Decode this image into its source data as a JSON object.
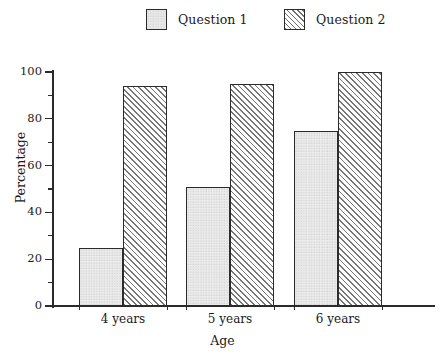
{
  "chart_data": {
    "type": "bar",
    "title": "",
    "subtitle": "",
    "xlabel": "Age",
    "ylabel": "Percentage",
    "categories": [
      "4 years",
      "5 years",
      "6 years"
    ],
    "series": [
      {
        "name": "Question 1",
        "values": [
          25,
          51,
          75
        ],
        "fill": "dotted-light-gray",
        "color": "#ececec"
      },
      {
        "name": "Question 2",
        "values": [
          94,
          95,
          100
        ],
        "fill": "diagonal-hatch",
        "color": "#757575"
      }
    ],
    "ylim": [
      0,
      100
    ],
    "ytick_labels": [
      "0",
      "20",
      "40",
      "60",
      "80",
      "100"
    ],
    "ytick_values": [
      0,
      20,
      40,
      60,
      80,
      100
    ],
    "yminor_values": [
      10,
      30,
      50,
      70,
      90
    ],
    "grid": false,
    "legend_position": "top-center",
    "legend_entries": [
      "Question 1",
      "Question 2"
    ],
    "axis_color": "#2b2b2b",
    "background_color": "#ffffff"
  },
  "legend": {
    "items": [
      {
        "label": "Question 1",
        "swatch": "solid-light-gray-square"
      },
      {
        "label": "Question 2",
        "swatch": "diagonal-hatched-square"
      }
    ]
  },
  "axes": {
    "y_title": "Percentage",
    "x_title": "Age"
  }
}
